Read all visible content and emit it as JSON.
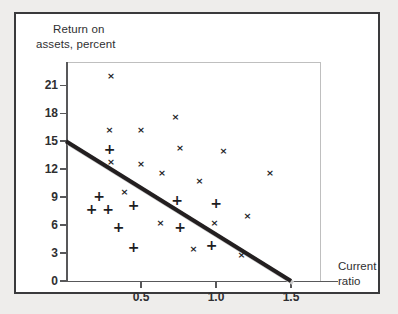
{
  "chart_data": {
    "type": "scatter",
    "title": "",
    "xlabel": "Current ratio",
    "ylabel": "Return on assets, percent",
    "xlabel_lines": [
      "Current",
      "ratio"
    ],
    "ylabel_lines": [
      "Return on",
      "assets, percent"
    ],
    "xlim": [
      0.0,
      1.7
    ],
    "ylim": [
      0.0,
      23.5
    ],
    "grid": false,
    "legend": null,
    "x_ticks": [
      {
        "value": 0.5,
        "label": "0.5"
      },
      {
        "value": 1.0,
        "label": "1.0"
      },
      {
        "value": 1.5,
        "label": "1.5"
      }
    ],
    "y_ticks": [
      {
        "value": 0,
        "label": "0"
      },
      {
        "value": 3,
        "label": "3"
      },
      {
        "value": 6,
        "label": "6"
      },
      {
        "value": 9,
        "label": "9"
      },
      {
        "value": 12,
        "label": "12"
      },
      {
        "value": 15,
        "label": "15"
      },
      {
        "value": 18,
        "label": "18"
      },
      {
        "value": 21,
        "label": "21"
      }
    ],
    "series": [
      {
        "name": "cross-markers",
        "marker": "x",
        "glyph": "×",
        "points": [
          {
            "x": 0.3,
            "y": 22.0
          },
          {
            "x": 0.29,
            "y": 16.2
          },
          {
            "x": 0.5,
            "y": 16.2
          },
          {
            "x": 0.73,
            "y": 17.6
          },
          {
            "x": 0.3,
            "y": 12.8
          },
          {
            "x": 0.5,
            "y": 12.6
          },
          {
            "x": 0.64,
            "y": 11.6
          },
          {
            "x": 0.76,
            "y": 14.3
          },
          {
            "x": 1.05,
            "y": 14.0
          },
          {
            "x": 0.89,
            "y": 10.7
          },
          {
            "x": 1.36,
            "y": 11.6
          },
          {
            "x": 0.39,
            "y": 9.5
          },
          {
            "x": 0.63,
            "y": 6.2
          },
          {
            "x": 0.99,
            "y": 6.2
          },
          {
            "x": 1.21,
            "y": 7.0
          },
          {
            "x": 0.85,
            "y": 3.4
          },
          {
            "x": 1.17,
            "y": 2.8
          }
        ]
      },
      {
        "name": "plus-markers",
        "marker": "+",
        "glyph": "＋",
        "points": [
          {
            "x": 0.29,
            "y": 14.2
          },
          {
            "x": 0.22,
            "y": 9.1
          },
          {
            "x": 0.17,
            "y": 7.7
          },
          {
            "x": 0.28,
            "y": 7.7
          },
          {
            "x": 0.45,
            "y": 8.2
          },
          {
            "x": 0.74,
            "y": 8.7
          },
          {
            "x": 1.0,
            "y": 8.4
          },
          {
            "x": 0.35,
            "y": 5.8
          },
          {
            "x": 0.76,
            "y": 5.8
          },
          {
            "x": 0.45,
            "y": 3.7
          },
          {
            "x": 0.97,
            "y": 3.9
          }
        ]
      }
    ],
    "trendline": {
      "name": "regression-line",
      "x1": 0.0,
      "y1": 15.0,
      "x2": 1.5,
      "y2": 0.0,
      "color": "#231f20",
      "width": 4
    },
    "axis_color": "#58585a",
    "frame_color": "#bfbfbf",
    "marker_color": "#1d1d1f"
  }
}
